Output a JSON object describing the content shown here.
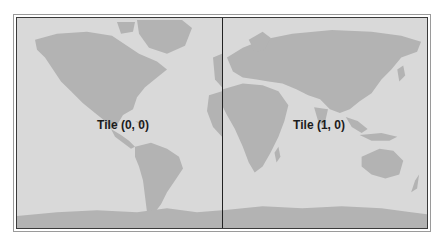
{
  "map": {
    "type": "world-map-tiles",
    "colors": {
      "ocean": "#d9d9d9",
      "land": "#b3b3b3",
      "divider": "#222222",
      "label": "#1c1c1c"
    },
    "tiles": [
      {
        "label": "Tile (0, 0)",
        "col": 0,
        "row": 0
      },
      {
        "label": "Tile (1, 0)",
        "col": 1,
        "row": 0
      }
    ]
  }
}
